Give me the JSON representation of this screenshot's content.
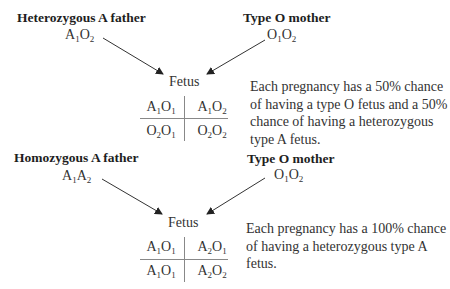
{
  "diagram": {
    "colors": {
      "text": "#2a2a2a",
      "lines": "#333333",
      "background": "#ffffff"
    },
    "crosses": [
      {
        "father": {
          "label": "Heterozygous A father",
          "genotype": [
            "A",
            "1",
            "O",
            "2"
          ]
        },
        "mother": {
          "label": "Type O mother",
          "genotype": [
            "O",
            "1",
            "O",
            "2"
          ]
        },
        "offspring_label": "Fetus",
        "punnett": [
          [
            [
              "A",
              "1",
              "O",
              "1"
            ],
            [
              "A",
              "1",
              "O",
              "2"
            ]
          ],
          [
            [
              "O",
              "2",
              "O",
              "1"
            ],
            [
              "O",
              "2",
              "O",
              "2"
            ]
          ]
        ],
        "description": "Each pregnancy has a 50% chance of having a type O fetus and a 50% chance of having a heterozygous type A fetus."
      },
      {
        "father": {
          "label": "Homozygous A father",
          "genotype": [
            "A",
            "1",
            "A",
            "2"
          ]
        },
        "mother": {
          "label": "Type O mother",
          "genotype": [
            "O",
            "1",
            "O",
            "2"
          ]
        },
        "offspring_label": "Fetus",
        "punnett": [
          [
            [
              "A",
              "1",
              "O",
              "1"
            ],
            [
              "A",
              "2",
              "O",
              "1"
            ]
          ],
          [
            [
              "A",
              "1",
              "O",
              "1"
            ],
            [
              "A",
              "2",
              "O",
              "2"
            ]
          ]
        ],
        "description": "Each pregnancy has a 100% chance of having a heterozygous type A fetus."
      }
    ]
  }
}
